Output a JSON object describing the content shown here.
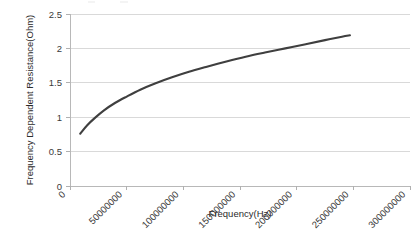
{
  "chart_data": {
    "type": "line",
    "title": "",
    "xlabel": "Frequency(Hz)",
    "ylabel": "Frequency Dependent Resistance(Ohm)",
    "xlim": [
      0,
      300000000
    ],
    "ylim": [
      0,
      2.5
    ],
    "xticks": [
      0,
      50000000,
      100000000,
      150000000,
      200000000,
      250000000,
      300000000
    ],
    "xtick_labels": [
      "0",
      "50000000",
      "100000000",
      "150000000",
      "200000000",
      "250000000",
      "300000000"
    ],
    "yticks": [
      0,
      0.5,
      1,
      1.5,
      2,
      2.5
    ],
    "ytick_labels": [
      "0",
      "0.5",
      "1",
      "1.5",
      "2",
      "2.5"
    ],
    "grid": "horizontal",
    "legend": "none",
    "series": [
      {
        "name": "Frequency Dependent Resistance",
        "color": "#3f3f3f",
        "x": [
          9000000,
          15000000,
          22000000,
          30000000,
          40000000,
          50000000,
          62000000,
          75000000,
          90000000,
          105000000,
          120000000,
          138000000,
          155000000,
          172000000,
          190000000,
          208000000,
          225000000,
          240000000,
          247000000
        ],
        "y": [
          0.76,
          0.88,
          0.99,
          1.1,
          1.21,
          1.3,
          1.4,
          1.49,
          1.58,
          1.66,
          1.73,
          1.81,
          1.88,
          1.94,
          2.0,
          2.06,
          2.12,
          2.17,
          2.19
        ]
      }
    ]
  },
  "axis": {
    "x_title": "Frequency(Hz)",
    "y_title": "Frequency Dependent Resistance(Ohm)"
  }
}
